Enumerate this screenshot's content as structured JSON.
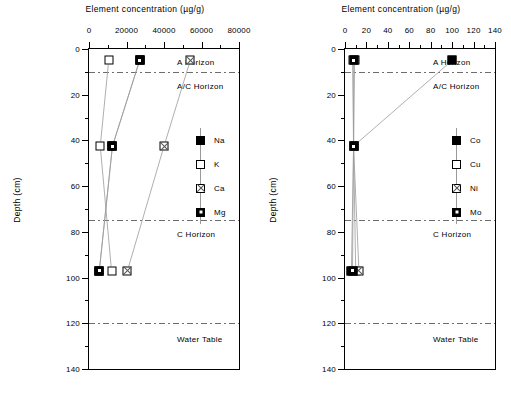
{
  "figure": {
    "units_label": "µg/g",
    "depth_units": "cm"
  },
  "chart_data": [
    {
      "type": "line",
      "panel": "left",
      "title": "",
      "xlabel": "Element concentration (µg/g)",
      "ylabel": "Depth (cm)",
      "xlim": [
        0,
        80000
      ],
      "ylim": [
        0,
        140
      ],
      "y_inverted": true,
      "xticks": [
        0,
        20000,
        40000,
        60000,
        80000
      ],
      "xticklabels": [
        "0",
        "20000",
        "40000",
        "60000",
        "80000"
      ],
      "yticks": [
        0,
        20,
        40,
        60,
        80,
        100,
        120,
        140
      ],
      "yticklabels": [
        "0",
        "20",
        "40",
        "60",
        "80",
        "100",
        "120",
        "140"
      ],
      "xminor_step": 10000,
      "yminor_step": 10,
      "grid": false,
      "legend_position": "right-inside",
      "annotations": [
        {
          "label": "A Horizon",
          "depth": 5.5,
          "line_depth": null
        },
        {
          "label": "A/C Horizon",
          "depth": 16,
          "line_depth": 10
        },
        {
          "label": "C Horizon",
          "depth": 81,
          "line_depth": 75
        },
        {
          "label": "Water Table",
          "depth": 127,
          "line_depth": 120
        }
      ],
      "series": [
        {
          "name": "Na",
          "marker": "filled-square",
          "depths": [
            5,
            42.5,
            97
          ],
          "values": [
            27000,
            12500,
            5500
          ]
        },
        {
          "name": "K",
          "marker": "open-square",
          "depths": [
            5,
            42.5,
            97
          ],
          "values": [
            10500,
            6000,
            12000
          ]
        },
        {
          "name": "Ca",
          "marker": "cross-square",
          "depths": [
            5,
            42.5,
            97
          ],
          "values": [
            54000,
            40000,
            20500
          ]
        },
        {
          "name": "Mg",
          "marker": "dot-square",
          "depths": [
            5,
            42.5,
            97
          ],
          "values": [
            27000,
            12500,
            5500
          ]
        }
      ]
    },
    {
      "type": "line",
      "panel": "right",
      "title": "",
      "xlabel": "Element concentration (µg/g)",
      "ylabel": "Depth (cm)",
      "xlim": [
        0,
        140
      ],
      "ylim": [
        0,
        140
      ],
      "y_inverted": true,
      "xticks": [
        0,
        20,
        40,
        60,
        80,
        100,
        120,
        140
      ],
      "xticklabels": [
        "0",
        "20",
        "40",
        "60",
        "80",
        "100",
        "120",
        "140"
      ],
      "yticks": [
        0,
        20,
        40,
        60,
        80,
        100,
        120,
        140
      ],
      "yticklabels": [
        "0",
        "20",
        "40",
        "60",
        "80",
        "100",
        "120",
        "140"
      ],
      "xminor_step": 10,
      "yminor_step": 10,
      "grid": false,
      "legend_position": "right-inside",
      "annotations": [
        {
          "label": "A Horizon",
          "depth": 5.5,
          "line_depth": null
        },
        {
          "label": "A/C Horizon",
          "depth": 16,
          "line_depth": 10
        },
        {
          "label": "C Horizon",
          "depth": 81,
          "line_depth": 75
        },
        {
          "label": "Water Table",
          "depth": 127,
          "line_depth": 120
        }
      ],
      "series": [
        {
          "name": "Co",
          "marker": "filled-square",
          "depths": [
            5,
            42.5,
            97
          ],
          "values": [
            100,
            8,
            6
          ]
        },
        {
          "name": "Cu",
          "marker": "open-square",
          "depths": [
            5,
            42.5,
            97
          ],
          "values": [
            7,
            8,
            10
          ]
        },
        {
          "name": "Ni",
          "marker": "cross-square",
          "depths": [
            5,
            42.5,
            97
          ],
          "values": [
            9,
            8,
            13
          ]
        },
        {
          "name": "Mo",
          "marker": "dot-square",
          "depths": [
            5,
            42.5,
            97
          ],
          "values": [
            8,
            8,
            7
          ]
        }
      ]
    }
  ],
  "colors": {
    "axis": "#000000",
    "horizon_line": "#6d6d6d",
    "series_line": "#9a9a9a",
    "marker_fill": "#000000",
    "marker_open": "#ffffff"
  }
}
